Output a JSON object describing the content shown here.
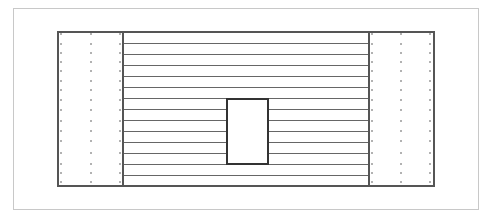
{
  "diagram": {
    "colors": {
      "frame": "#c8c8c8",
      "outline": "#555555",
      "stripe": "#666666",
      "dot": "#777777",
      "background": "#ffffff"
    },
    "outer_frame": {
      "x": 13,
      "y": 8,
      "w": 466,
      "h": 202
    },
    "main_box": {
      "x": 58,
      "y": 32,
      "w": 376,
      "h": 154
    },
    "left_panel": {
      "x": 58,
      "divider_x": 123,
      "dot_columns": [
        61,
        91,
        120
      ]
    },
    "right_panel": {
      "divider_x": 369,
      "x_end": 434,
      "dot_columns": [
        372,
        401,
        430
      ]
    },
    "dot_rows": [
      34,
      44,
      53,
      62,
      71,
      81,
      90,
      100,
      110,
      121,
      131,
      141,
      153,
      164,
      173,
      182
    ],
    "stripe_lines_y": [
      43,
      54,
      65,
      76,
      87,
      98,
      109,
      120,
      131,
      142,
      153,
      164,
      175
    ],
    "stripe_x_range": [
      123,
      369
    ],
    "inner_rect": {
      "x": 227,
      "y": 99,
      "w": 41,
      "h": 65
    }
  }
}
